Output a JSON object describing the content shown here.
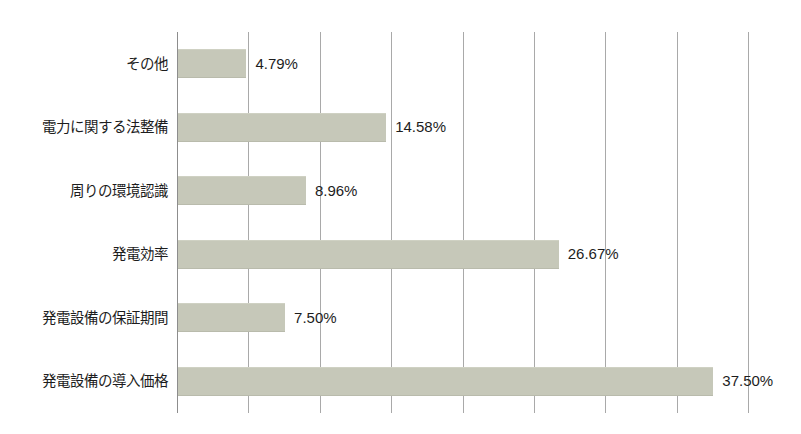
{
  "chart_data": {
    "type": "bar",
    "orientation": "horizontal",
    "title": "",
    "subtitle": "",
    "xlabel": "",
    "ylabel": "",
    "xlim": [
      0,
      40
    ],
    "grid": true,
    "gridlines": [
      0,
      5,
      10,
      15,
      20,
      25,
      30,
      35,
      40
    ],
    "legend": "none",
    "value_suffix": "%",
    "categories": [
      "その他",
      "電力に関する法整備",
      "周りの環境認識",
      "発電効率",
      "発電設備の保証期間",
      "発電設備の導入価格"
    ],
    "values": [
      4.79,
      14.58,
      8.96,
      26.67,
      7.5,
      37.5
    ],
    "value_labels": [
      "4.79%",
      "14.58%",
      "8.96%",
      "26.67%",
      "7.50%",
      "37.50%"
    ],
    "bars": [
      {
        "category": "その他",
        "value": 4.79,
        "label": "4.79%"
      },
      {
        "category": "電力に関する法整備",
        "value": 14.58,
        "label": "14.58%"
      },
      {
        "category": "周りの環境認識",
        "value": 8.96,
        "label": "8.96%"
      },
      {
        "category": "発電効率",
        "value": 26.67,
        "label": "26.67%"
      },
      {
        "category": "発電設備の保証期間",
        "value": 7.5,
        "label": "7.50%"
      },
      {
        "category": "発電設備の導入価格",
        "value": 37.5,
        "label": "37.50%"
      }
    ],
    "colors": {
      "bar_fill": "#c6c8b9",
      "gridline": "#a9a9a9",
      "axis_line": "#8d8d8d",
      "text": "#1d1d1d",
      "background": "#ffffff"
    }
  },
  "artifacts": {
    "top_clipped_text": "",
    "bottom_clipped_text": ""
  }
}
